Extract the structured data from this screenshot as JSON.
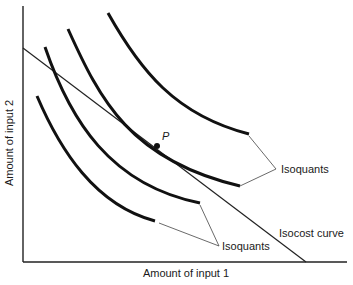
{
  "diagram": {
    "type": "isoquant-isocost",
    "x_axis_label": "Amount of input 1",
    "y_axis_label": "Amount of input 2",
    "point_label": "P",
    "isocost_label": "Isocost curve",
    "isoquant_label_upper": "Isoquants",
    "isoquant_label_lower": "Isoquants",
    "isoquant_count": 4,
    "colors": {
      "curve": "#111111",
      "line": "#222222",
      "background": "#ffffff"
    }
  }
}
